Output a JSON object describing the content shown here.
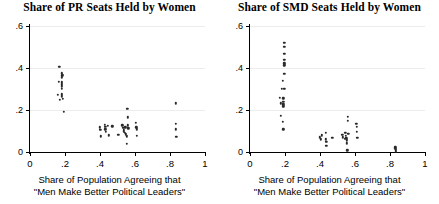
{
  "figure": {
    "background_color": "#ffffff",
    "point_color": "#2a2a2a",
    "grid_color": "#ececec",
    "axis_color": "#000000"
  },
  "axis_caption": {
    "line1": "Share of Population Agreeing that",
    "line2": "\"Men Make Better Political Leaders\""
  },
  "chart_data": [
    {
      "type": "scatter",
      "title": "Share of PR Seats Held by Women",
      "xlabel": "Share of Population Agreeing that \"Men Make Better Political Leaders\"",
      "ylabel": "",
      "xlim": [
        0,
        1
      ],
      "ylim": [
        0,
        0.6
      ],
      "xticks": [
        0,
        0.2,
        0.4,
        0.6,
        0.8,
        1
      ],
      "xticklabels": [
        "0",
        ".2",
        ".4",
        ".6",
        ".8",
        "1"
      ],
      "yticks": [
        0,
        0.2,
        0.4,
        0.6
      ],
      "yticklabels": [
        "0",
        ".2",
        ".4",
        ".6"
      ],
      "grid": "horizontal",
      "legend": "none",
      "points": [
        [
          0.168,
          0.405
        ],
        [
          0.183,
          0.375
        ],
        [
          0.185,
          0.365
        ],
        [
          0.183,
          0.355
        ],
        [
          0.163,
          0.335
        ],
        [
          0.182,
          0.332
        ],
        [
          0.183,
          0.322
        ],
        [
          0.182,
          0.312
        ],
        [
          0.18,
          0.3
        ],
        [
          0.16,
          0.272
        ],
        [
          0.183,
          0.275
        ],
        [
          0.182,
          0.265
        ],
        [
          0.172,
          0.25
        ],
        [
          0.188,
          0.252
        ],
        [
          0.192,
          0.19
        ],
        [
          0.4,
          0.118
        ],
        [
          0.402,
          0.105
        ],
        [
          0.405,
          0.075
        ],
        [
          0.428,
          0.13
        ],
        [
          0.43,
          0.12
        ],
        [
          0.43,
          0.108
        ],
        [
          0.432,
          0.095
        ],
        [
          0.445,
          0.125
        ],
        [
          0.452,
          0.08
        ],
        [
          0.47,
          0.122
        ],
        [
          0.505,
          0.082
        ],
        [
          0.528,
          0.128
        ],
        [
          0.533,
          0.115
        ],
        [
          0.535,
          0.105
        ],
        [
          0.536,
          0.098
        ],
        [
          0.54,
          0.09
        ],
        [
          0.545,
          0.118
        ],
        [
          0.548,
          0.085
        ],
        [
          0.552,
          0.075
        ],
        [
          0.552,
          0.04
        ],
        [
          0.556,
          0.205
        ],
        [
          0.558,
          0.165
        ],
        [
          0.56,
          0.128
        ],
        [
          0.562,
          0.112
        ],
        [
          0.606,
          0.14
        ],
        [
          0.608,
          0.118
        ],
        [
          0.61,
          0.108
        ],
        [
          0.612,
          0.078
        ],
        [
          0.832,
          0.232
        ],
        [
          0.833,
          0.135
        ],
        [
          0.834,
          0.108
        ],
        [
          0.835,
          0.072
        ]
      ]
    },
    {
      "type": "scatter",
      "title": "Share of SMD Seats Held by Women",
      "xlabel": "Share of Population Agreeing that \"Men Make Better Political Leaders\"",
      "ylabel": "",
      "xlim": [
        0,
        1
      ],
      "ylim": [
        0,
        0.6
      ],
      "xticks": [
        0,
        0.2,
        0.4,
        0.6,
        0.8,
        1
      ],
      "xticklabels": [
        "0",
        ".2",
        ".4",
        ".6",
        ".8",
        "1"
      ],
      "yticks": [
        0,
        0.2,
        0.4,
        0.6
      ],
      "yticklabels": [
        "0",
        ".2",
        ".4",
        ".6"
      ],
      "grid": "horizontal",
      "legend": "none",
      "points": [
        [
          0.196,
          0.52
        ],
        [
          0.196,
          0.5
        ],
        [
          0.196,
          0.468
        ],
        [
          0.196,
          0.44
        ],
        [
          0.196,
          0.422
        ],
        [
          0.196,
          0.412
        ],
        [
          0.196,
          0.372
        ],
        [
          0.186,
          0.34
        ],
        [
          0.183,
          0.302
        ],
        [
          0.196,
          0.3
        ],
        [
          0.172,
          0.258
        ],
        [
          0.19,
          0.255
        ],
        [
          0.176,
          0.232
        ],
        [
          0.19,
          0.238
        ],
        [
          0.19,
          0.228
        ],
        [
          0.19,
          0.218
        ],
        [
          0.176,
          0.172
        ],
        [
          0.186,
          0.145
        ],
        [
          0.19,
          0.108
        ],
        [
          0.4,
          0.07
        ],
        [
          0.404,
          0.06
        ],
        [
          0.412,
          0.08
        ],
        [
          0.432,
          0.09
        ],
        [
          0.434,
          0.06
        ],
        [
          0.436,
          0.048
        ],
        [
          0.436,
          0.03
        ],
        [
          0.47,
          0.068
        ],
        [
          0.528,
          0.082
        ],
        [
          0.532,
          0.07
        ],
        [
          0.54,
          0.062
        ],
        [
          0.545,
          0.092
        ],
        [
          0.548,
          0.078
        ],
        [
          0.55,
          0.066
        ],
        [
          0.552,
          0.055
        ],
        [
          0.554,
          0.042
        ],
        [
          0.556,
          0.008
        ],
        [
          0.558,
          0.168
        ],
        [
          0.56,
          0.15
        ],
        [
          0.562,
          0.088
        ],
        [
          0.608,
          0.135
        ],
        [
          0.61,
          0.12
        ],
        [
          0.612,
          0.095
        ],
        [
          0.614,
          0.068
        ],
        [
          0.83,
          0.022
        ],
        [
          0.831,
          0.014
        ],
        [
          0.832,
          0.008
        ],
        [
          0.833,
          0.002
        ]
      ]
    }
  ]
}
